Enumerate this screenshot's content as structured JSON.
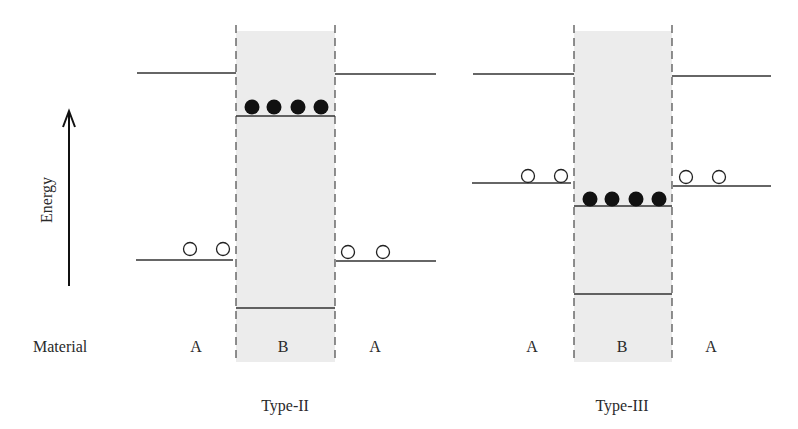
{
  "axis": {
    "label": "Energy",
    "icon": "up-arrow-icon"
  },
  "row_label": "Material",
  "colors": {
    "line": "#333333",
    "shade": "#ececec",
    "dash": "#555555",
    "electron": "#111111",
    "hole_fill": "#ffffff"
  },
  "panels": [
    {
      "title": "Type-II",
      "materials": [
        "A",
        "B",
        "A"
      ],
      "well": {
        "x0": 235,
        "x1": 335
      },
      "left_x": [
        137,
        235
      ],
      "right_x": [
        335,
        436
      ],
      "conduction": {
        "outer_y": 73,
        "inner_y": 116
      },
      "valence": {
        "outer_y": 260,
        "inner_y": 308
      },
      "electrons": {
        "y": 107,
        "xs": [
          253,
          276,
          300,
          322
        ]
      },
      "holes": {
        "left": {
          "y": 249,
          "xs": [
            190,
            223
          ]
        },
        "right": {
          "y": 252,
          "xs": [
            348,
            383
          ]
        }
      }
    },
    {
      "title": "Type-III",
      "materials": [
        "A",
        "B",
        "A"
      ],
      "well": {
        "x0": 574,
        "x1": 672
      },
      "left_x": [
        473,
        574
      ],
      "right_x": [
        672,
        771
      ],
      "conduction": {
        "outer_y": 74,
        "inner_y": 0
      },
      "valence": {
        "outer_y": 184,
        "inner_y": 294
      },
      "fermi_inner_y": 206,
      "electrons": {
        "y": 198,
        "xs": [
          591,
          612,
          635,
          658
        ]
      },
      "holes": {
        "left": {
          "y": 175,
          "xs": [
            528,
            561
          ]
        },
        "right": {
          "y": 176,
          "xs": [
            686,
            719
          ]
        }
      }
    }
  ]
}
